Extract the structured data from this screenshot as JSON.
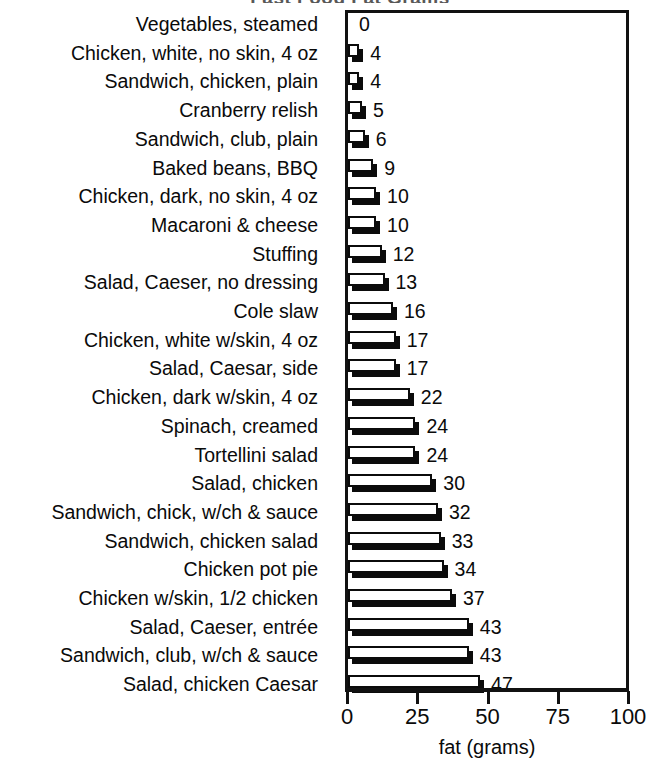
{
  "chart_data": {
    "type": "bar",
    "orientation": "horizontal",
    "title": "Fast Food Fat Grams",
    "title_clipped": true,
    "xlabel": "fat (grams)",
    "ylabel": "",
    "xlim": [
      0,
      100
    ],
    "xticks": [
      0,
      25,
      50,
      75,
      100
    ],
    "xtick_labels": [
      "0",
      "25",
      "50",
      "75",
      "100"
    ],
    "grid": false,
    "legend": null,
    "value_labels_shown": true,
    "categories": [
      "Vegetables, steamed",
      "Chicken, white, no skin, 4 oz",
      "Sandwich, chicken, plain",
      "Cranberry relish",
      "Sandwich, club, plain",
      "Baked beans, BBQ",
      "Chicken, dark, no skin, 4 oz",
      "Macaroni & cheese",
      "Stuffing",
      "Salad, Caeser, no dressing",
      "Cole slaw",
      "Chicken, white w/skin, 4 oz",
      "Salad, Caesar, side",
      "Chicken, dark w/skin, 4 oz",
      "Spinach, creamed",
      "Tortellini salad",
      "Salad, chicken",
      "Sandwich, chick, w/ch & sauce",
      "Sandwich, chicken salad",
      "Chicken pot pie",
      "Chicken w/skin, 1/2 chicken",
      "Salad, Caeser, entrée",
      "Sandwich, club, w/ch & sauce",
      "Salad, chicken Caesar"
    ],
    "values": [
      0,
      4,
      4,
      5,
      6,
      9,
      10,
      10,
      12,
      13,
      16,
      17,
      17,
      22,
      24,
      24,
      30,
      32,
      33,
      34,
      37,
      43,
      43,
      47
    ],
    "value_strings": [
      "0",
      "4",
      "4",
      "5",
      "6",
      "9",
      "10",
      "10",
      "12",
      "13",
      "16",
      "17",
      "17",
      "22",
      "24",
      "24",
      "30",
      "32",
      "33",
      "34",
      "37",
      "43",
      "43",
      "47"
    ],
    "colors": {
      "bar_face": "#ffffff",
      "bar_outline": "#0b0b0b",
      "bar_shadow": "#0b0b0b",
      "axis": "#111111",
      "text": "#0a0a0a",
      "background": "#ffffff"
    }
  }
}
